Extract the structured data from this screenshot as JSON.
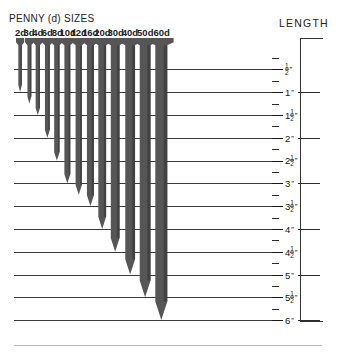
{
  "header": {
    "title": "PENNY (d) SIZES",
    "length_title": "LENGTH"
  },
  "chart_data": {
    "type": "bar",
    "title": "PENNY (d) SIZES",
    "subtitle": "",
    "xlabel": "PENNY (d) SIZES",
    "ylabel": "LENGTH",
    "orientation": "vertical-downward",
    "grid": true,
    "legend_position": "none",
    "ylim": [
      0,
      6
    ],
    "yunit": "inches",
    "categories": [
      "2d",
      "3d",
      "4d",
      "6d",
      "8d",
      "10d",
      "12d",
      "16d",
      "20d",
      "30d",
      "40d",
      "50d",
      "60d"
    ],
    "values": [
      1,
      1.25,
      1.5,
      2,
      2.5,
      3,
      3.25,
      3.5,
      4,
      4.5,
      5,
      5.5,
      6
    ],
    "value_labels": [
      "1\"",
      "1 1/4\"",
      "1 1/2\"",
      "2\"",
      "2 1/2\"",
      "3\"",
      "3 1/4\"",
      "3 1/2\"",
      "4\"",
      "4 1/2\"",
      "5\"",
      "5 1/2\"",
      "6\""
    ],
    "axis_ticks": [
      {
        "value": 0.5,
        "whole": "",
        "num": "1",
        "den": "2",
        "mark": "”",
        "major": true
      },
      {
        "value": 1.0,
        "whole": "1",
        "num": "",
        "den": "",
        "mark": "”",
        "major": true
      },
      {
        "value": 1.5,
        "whole": "1",
        "num": "1",
        "den": "2",
        "mark": "”",
        "major": true
      },
      {
        "value": 2.0,
        "whole": "2",
        "num": "",
        "den": "",
        "mark": "”",
        "major": true
      },
      {
        "value": 2.5,
        "whole": "2",
        "num": "1",
        "den": "2",
        "mark": "”",
        "major": true
      },
      {
        "value": 3.0,
        "whole": "3",
        "num": "",
        "den": "",
        "mark": "”",
        "major": true
      },
      {
        "value": 3.5,
        "whole": "3",
        "num": "1",
        "den": "2",
        "mark": "”",
        "major": true
      },
      {
        "value": 4.0,
        "whole": "4",
        "num": "",
        "den": "",
        "mark": "”",
        "major": true
      },
      {
        "value": 4.5,
        "whole": "4",
        "num": "1",
        "den": "2",
        "mark": "”",
        "major": true
      },
      {
        "value": 5.0,
        "whole": "5",
        "num": "",
        "den": "",
        "mark": "”",
        "major": true
      },
      {
        "value": 5.5,
        "whole": "5",
        "num": "1",
        "den": "2",
        "mark": "”",
        "major": true
      },
      {
        "value": 6.0,
        "whole": "6",
        "num": "",
        "den": "",
        "mark": "”",
        "major": true
      }
    ],
    "minor_tick_values": [
      0.25,
      0.75,
      1.25,
      1.75,
      2.25,
      2.75,
      3.25,
      3.75,
      4.25,
      4.75,
      5.25,
      5.75
    ],
    "gridline_values": [
      0.5,
      1.0,
      1.5,
      2.0,
      2.5,
      3.0,
      3.5,
      4.0,
      4.5,
      5.0,
      5.5,
      6.0
    ],
    "nail_widths": [
      3.6,
      3.9,
      4.3,
      4.9,
      5.4,
      5.9,
      6.3,
      7.0,
      7.8,
      8.8,
      9.8,
      10.8,
      12.0
    ],
    "colors": {
      "nail_fill": "#565656",
      "nail_shade": "#3c3c3c",
      "gridline": "#3a3a3a",
      "text": "#1a1a1a",
      "background": "#ffffff",
      "rule": "#b9b9b9"
    }
  }
}
